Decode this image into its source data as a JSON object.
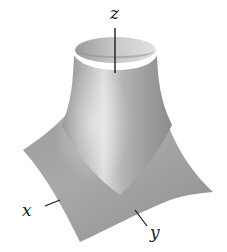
{
  "figure": {
    "type": "3d-surface-plot",
    "axes": {
      "x": {
        "label": "x"
      },
      "y": {
        "label": "y"
      },
      "z": {
        "label": "z"
      }
    },
    "colors": {
      "surface_light": "#d9d9d9",
      "surface_mid": "#a8a8a8",
      "surface_dark": "#7a7a7a",
      "axis_line": "#1a1a1a",
      "background": "#ffffff"
    }
  }
}
